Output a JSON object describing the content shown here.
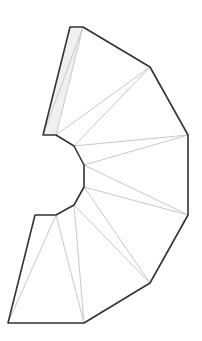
{
  "diagram": {
    "type": "unfolded-polygon-net",
    "colors": {
      "background": "#ffffff",
      "outline": "#333333",
      "fold_line": "#c8c8c8",
      "shaded_fill": "#f0f0f0"
    },
    "vertices": {
      "A": [
        70,
        27
      ],
      "B": [
        83,
        27
      ],
      "C": [
        150,
        67
      ],
      "D": [
        188,
        135
      ],
      "E": [
        188,
        215
      ],
      "F": [
        150,
        283
      ],
      "G": [
        84,
        323
      ],
      "H": [
        8,
        323
      ],
      "I": [
        35,
        215
      ],
      "J": [
        56,
        215
      ],
      "K": [
        74,
        205
      ],
      "L": [
        84,
        187
      ],
      "M": [
        84,
        165
      ],
      "N": [
        74,
        146
      ],
      "O": [
        56,
        135
      ],
      "P": [
        43,
        135
      ]
    },
    "outline_order": [
      "A",
      "B",
      "C",
      "D",
      "E",
      "F",
      "G",
      "H",
      "I",
      "J",
      "K",
      "L",
      "M",
      "N",
      "O",
      "P"
    ],
    "shaded_region": [
      "A",
      "B",
      "O",
      "P"
    ],
    "fold_lines": [
      [
        "B",
        "P"
      ],
      [
        "B",
        "O"
      ],
      [
        "O",
        "C"
      ],
      [
        "N",
        "C"
      ],
      [
        "N",
        "D"
      ],
      [
        "M",
        "D"
      ],
      [
        "M",
        "E"
      ],
      [
        "L",
        "E"
      ],
      [
        "L",
        "F"
      ],
      [
        "K",
        "F"
      ],
      [
        "K",
        "G"
      ],
      [
        "J",
        "G"
      ],
      [
        "J",
        "H"
      ]
    ]
  }
}
